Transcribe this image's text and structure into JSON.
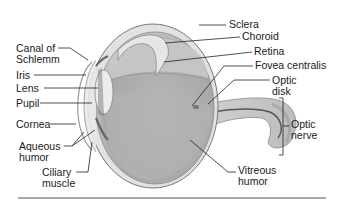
{
  "labels_left": {
    "canal_of_schlemm": [
      "Canal of",
      "Schlemm"
    ],
    "iris": "Iris",
    "lens": "Lens",
    "pupil": "Pupil",
    "cornea": "Cornea",
    "aqueous_humor": [
      "Aqueous",
      "humor"
    ],
    "ciliary_muscle": [
      "Ciliary",
      "muscle"
    ]
  },
  "labels_right": {
    "sclera": "Sclera",
    "choroid": "Choroid",
    "retina": "Retina",
    "fovea_centralis": "Fovea centralis",
    "optic_disk": [
      "Optic",
      "disk"
    ],
    "optic_nerve": [
      "Optic",
      "nerve"
    ],
    "vitreous_humor": [
      "Vitreous",
      "humor"
    ]
  },
  "colors": {
    "eye_fill": "#c9c9c9",
    "eye_dark": "#9a9a9a",
    "line": "#333333",
    "text": "#1a1a1a"
  }
}
